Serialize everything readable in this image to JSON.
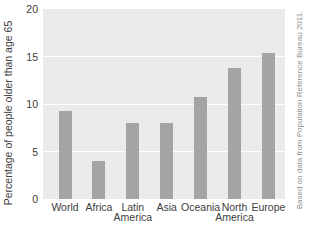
{
  "chart_data": {
    "type": "bar",
    "title": "",
    "xlabel": "",
    "ylabel": "Percentage of people older than age 65",
    "ylim": [
      0,
      20
    ],
    "yticks": [
      0,
      5,
      10,
      15,
      20
    ],
    "grid": true,
    "legend_position": "none",
    "categories": [
      "World",
      "Africa",
      "Latin America",
      "Asia",
      "Oceania",
      "North America",
      "Europe"
    ],
    "category_label_lines": [
      [
        "World"
      ],
      [
        "Africa"
      ],
      [
        "Latin",
        "America"
      ],
      [
        "Asia"
      ],
      [
        "Oceania"
      ],
      [
        "North",
        "America"
      ],
      [
        "Europe"
      ]
    ],
    "values": [
      9.3,
      4,
      8,
      8,
      10.7,
      13.8,
      15.4
    ],
    "annotation": "Based on data from Population Reference Bureau 2011.",
    "colors": {
      "bar": "#a4a4a4",
      "plot_background": "#ebebeb",
      "gridline": "#ffffff",
      "axis_text": "#404040",
      "note_text": "#8f8f8f"
    }
  }
}
